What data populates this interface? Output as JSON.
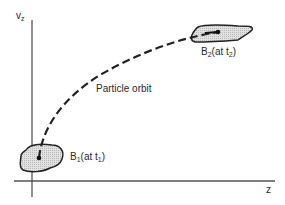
{
  "diagram": {
    "axes": {
      "y_label": "v",
      "y_label_sub": "z",
      "x_label": "z"
    },
    "curve_label": "Particle orbit",
    "start_region": {
      "name": "B",
      "sub": "1",
      "paren_open": "(at t",
      "paren_sub": "1",
      "paren_close": ")"
    },
    "end_region": {
      "name": "B",
      "sub": "2",
      "paren_open": "(at t",
      "paren_sub": "2",
      "paren_close": ")"
    },
    "colors": {
      "line": "#2b2b2b",
      "fill": "#d4d4d4",
      "background": "#ffffff"
    }
  }
}
